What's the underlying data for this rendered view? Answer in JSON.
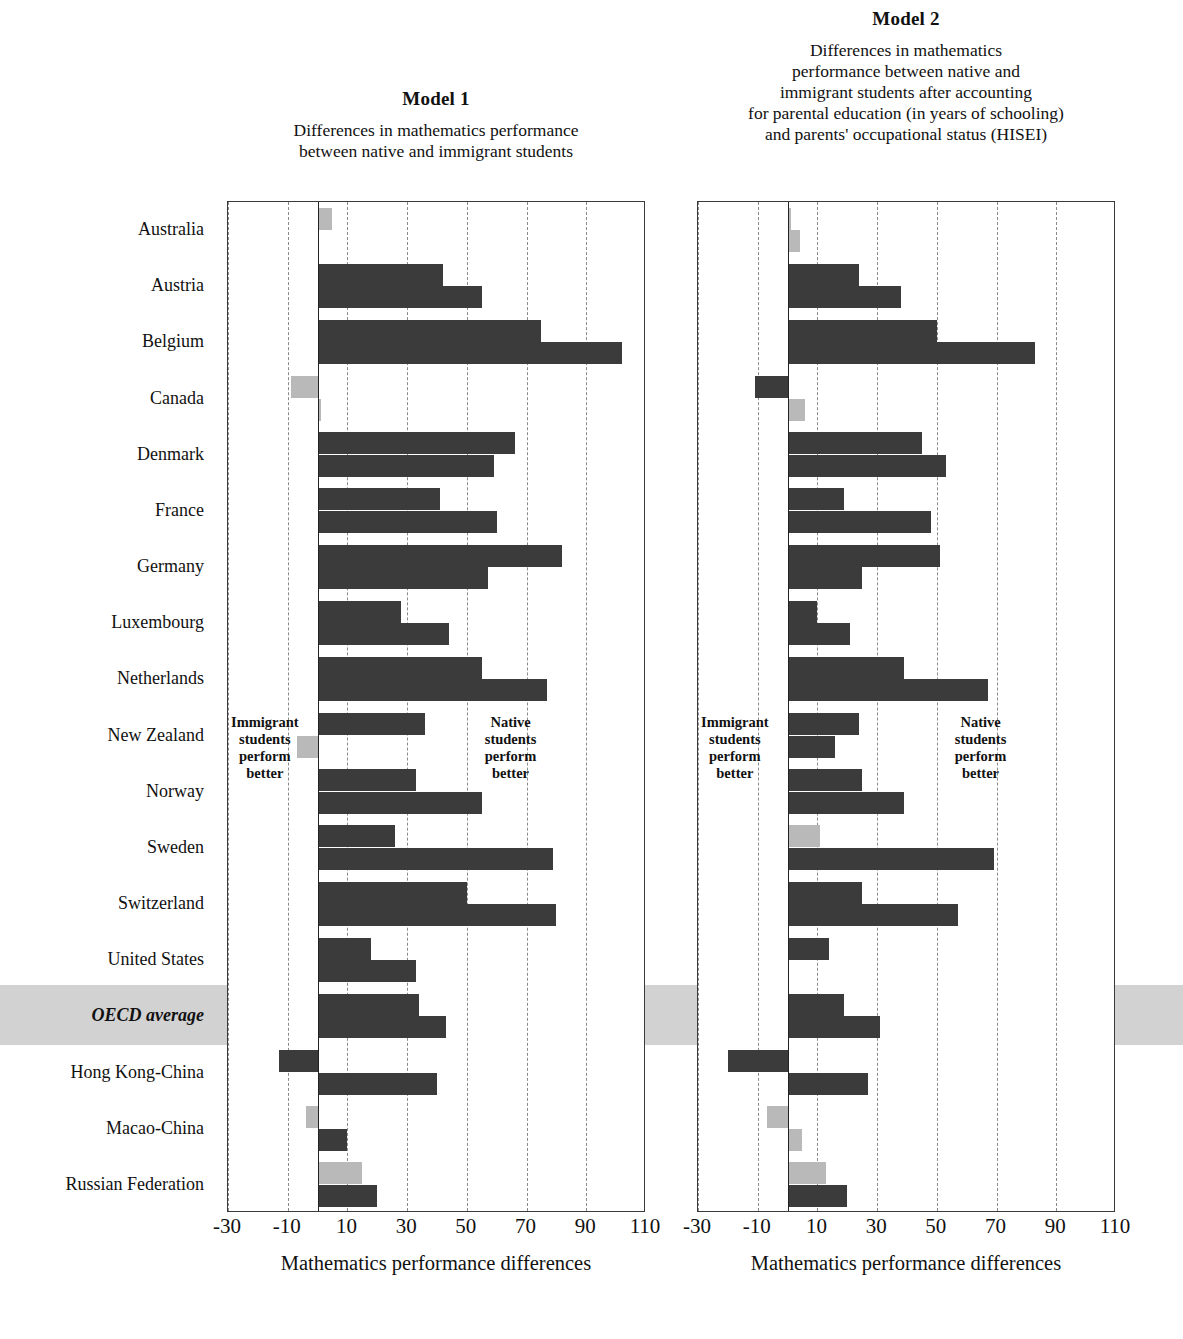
{
  "panels": [
    {
      "id": "model-1",
      "title": "Model 1",
      "subtitle_lines": [
        "Differences in mathematics performance",
        "between native and immigrant students"
      ],
      "axis_title": "Mathematics performance differences",
      "note_left_lines": [
        "Immigrant",
        "students",
        "perform",
        "better"
      ],
      "note_right_lines": [
        "Native",
        "students",
        "perform",
        "better"
      ]
    },
    {
      "id": "model-2",
      "title": "Model 2",
      "subtitle_lines": [
        "Differences in mathematics",
        "performance between native and",
        "immigrant students after accounting",
        "for parental education (in years of schooling)",
        "and parents' occupational status (HISEI)"
      ],
      "axis_title": "Mathematics performance differences",
      "note_left_lines": [
        "Immigrant",
        "students",
        "perform",
        "better"
      ],
      "note_right_lines": [
        "Native",
        "students",
        "perform",
        "better"
      ]
    }
  ],
  "colors": {
    "bar_dark": "#3b3b3b",
    "bar_light": "#b9b9b9",
    "highlight_band": "#d2d2d2",
    "gridline": "#8a8a8a",
    "axis": "#3a3a3a"
  },
  "chart_data": {
    "type": "bar",
    "title": "Differences in mathematics performance between native and immigrant students",
    "orientation": "horizontal",
    "grouped": true,
    "bars_per_category": 2,
    "xlabel": "Mathematics performance differences",
    "ylabel": "",
    "xlim": [
      -30,
      110
    ],
    "xticks": [
      -30,
      -10,
      10,
      30,
      50,
      70,
      90,
      110
    ],
    "xticklabels": [
      "-30",
      "-10",
      "10",
      "30",
      "50",
      "70",
      "90",
      "110"
    ],
    "grid": "vertical dashed at every tick",
    "legend": "none",
    "series_note": "Within each country two bars are shown (first-generation and second-generation/native-language groupings). Light grey bars denote statistically non-significant differences.",
    "categories": [
      "Australia",
      "Austria",
      "Belgium",
      "Canada",
      "Denmark",
      "France",
      "Germany",
      "Luxembourg",
      "Netherlands",
      "New Zealand",
      "Norway",
      "Sweden",
      "Switzerland",
      "United States",
      "OECD average",
      "Hong Kong-China",
      "Macao-China",
      "Russian Federation"
    ],
    "highlight_category": "OECD average",
    "panels": [
      {
        "name": "Model 1",
        "subtitle": "Differences in mathematics performance between native and immigrant students",
        "series": [
          {
            "name": "bar-a",
            "values": [
              5,
              42,
              75,
              -9,
              66,
              41,
              82,
              28,
              55,
              36,
              33,
              26,
              50,
              18,
              34,
              -13,
              -4,
              15
            ],
            "significant": [
              false,
              true,
              true,
              false,
              true,
              true,
              true,
              true,
              true,
              true,
              true,
              true,
              true,
              true,
              true,
              true,
              false,
              false
            ]
          },
          {
            "name": "bar-b",
            "values": [
              0,
              55,
              102,
              1,
              59,
              60,
              57,
              44,
              77,
              -7,
              55,
              79,
              80,
              33,
              43,
              40,
              10,
              20
            ],
            "significant": [
              false,
              true,
              true,
              false,
              true,
              true,
              true,
              true,
              true,
              false,
              true,
              true,
              true,
              true,
              true,
              true,
              true,
              true
            ]
          }
        ]
      },
      {
        "name": "Model 2",
        "subtitle": "Differences in mathematics performance between native and immigrant students after accounting for parental education (in years of schooling) and parents' occupational status (HISEI)",
        "series": [
          {
            "name": "bar-a",
            "values": [
              1,
              24,
              50,
              -11,
              45,
              19,
              51,
              10,
              39,
              24,
              25,
              11,
              25,
              14,
              19,
              -20,
              -7,
              13
            ],
            "significant": [
              false,
              true,
              true,
              true,
              true,
              true,
              true,
              true,
              true,
              true,
              true,
              false,
              true,
              true,
              true,
              true,
              false,
              false
            ]
          },
          {
            "name": "bar-b",
            "values": [
              4,
              38,
              83,
              6,
              53,
              48,
              25,
              21,
              67,
              16,
              39,
              69,
              57,
              0,
              31,
              27,
              5,
              20
            ],
            "significant": [
              false,
              true,
              true,
              false,
              true,
              true,
              true,
              true,
              true,
              true,
              true,
              true,
              true,
              false,
              true,
              true,
              false,
              true
            ]
          }
        ]
      }
    ]
  }
}
